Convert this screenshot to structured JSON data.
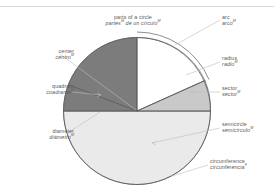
{
  "figure": {
    "title": {
      "en": "parts of a circle",
      "es": "partes",
      "es_rest": " de un círculo",
      "es_sup1": "M",
      "es_sup2": "M"
    },
    "diagram_type": "labeled-circle-diagram",
    "colors": {
      "quadrant_fill": "#7c7c7c",
      "sector_fill": "#c9c9c9",
      "semicircle_fill": "#eaeaea",
      "arc_region_fill": "#ffffff",
      "outline": "#5a5a5a",
      "leader_line": "#b8b8b8",
      "text": "#5c5c5c",
      "background": "#ffffff"
    },
    "labels": [
      {
        "id": "arc",
        "en": "arc",
        "es": "arco",
        "sup": "M",
        "side": "right"
      },
      {
        "id": "radius",
        "en": "radius",
        "es": "radio",
        "sup": "M",
        "side": "right"
      },
      {
        "id": "sector",
        "en": "sector",
        "es": "sector",
        "sup": "M",
        "side": "right"
      },
      {
        "id": "semicircle",
        "en": "semicircle",
        "es": "semicírculo",
        "sup": "M",
        "side": "right"
      },
      {
        "id": "circumference",
        "en": "circumference",
        "es": "circunferencia",
        "sup": "F",
        "side": "right"
      },
      {
        "id": "center",
        "en": "center",
        "es": "centro",
        "sup": "M",
        "side": "left"
      },
      {
        "id": "quadrant",
        "en": "quadrant",
        "es": "cuadrante",
        "sup": "M",
        "side": "left"
      },
      {
        "id": "diameter",
        "en": "diameter",
        "es": "diámetro",
        "sup": "M",
        "side": "left"
      }
    ]
  }
}
